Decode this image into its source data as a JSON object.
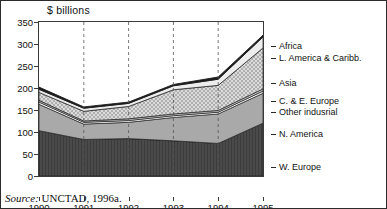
{
  "figure": {
    "axis_title": "$ billions",
    "source": "Source:",
    "source_text": " UNCTAD, 1996a."
  },
  "chart_data": {
    "type": "area",
    "title": "$ billions",
    "xlabel": "",
    "ylabel": "$ billions",
    "ylim": [
      0,
      350
    ],
    "ytick_step": 50,
    "yticks": [
      0,
      50,
      100,
      150,
      200,
      250,
      300,
      350
    ],
    "grid": "vertical-dashed",
    "legend_position": "right",
    "stacked": true,
    "categories": [
      "1990",
      "1991",
      "1992",
      "1993",
      "1994",
      "1995"
    ],
    "series": [
      {
        "name": "W. Europe",
        "values": [
          103,
          83,
          85,
          80,
          74,
          120
        ]
      },
      {
        "name": "N. America",
        "values": [
          60,
          35,
          37,
          53,
          67,
          68
        ]
      },
      {
        "name": "Other indusrial",
        "values": [
          5,
          4,
          4,
          4,
          4,
          5
        ]
      },
      {
        "name": "C. & E. Europe",
        "values": [
          4,
          3,
          4,
          4,
          4,
          5
        ]
      },
      {
        "name": "Asia",
        "values": [
          18,
          22,
          28,
          55,
          57,
          93
        ]
      },
      {
        "name": "L. America & Caribb.",
        "values": [
          7,
          7,
          7,
          9,
          14,
          25
        ]
      },
      {
        "name": "Africa",
        "values": [
          5,
          3,
          3,
          3,
          5,
          4
        ]
      }
    ],
    "totals": [
      202,
      157,
      168,
      208,
      225,
      320
    ]
  },
  "axis": {
    "y_labels": [
      "350",
      "300",
      "250",
      "200",
      "150",
      "100",
      "50",
      "0"
    ],
    "x_labels": [
      "1990",
      "1991",
      "1992",
      "1993",
      "1994",
      "1995"
    ]
  },
  "legend": {
    "items": [
      {
        "label": "Africa"
      },
      {
        "label": "L. America & Caribb."
      },
      {
        "label": "Asia"
      },
      {
        "label": "C. & E. Europe"
      },
      {
        "label": "Other indusrial"
      },
      {
        "label": "N. America"
      },
      {
        "label": "W. Europe"
      }
    ]
  },
  "colors": {
    "w_europe": "#4a4a4a",
    "n_america": "#a9a9a9",
    "other_industrial": "#ffffff",
    "c_e_europe": "#c9c9c9",
    "asia": "#d0d0d0",
    "l_america": "#e8e8e8",
    "africa": "#1c1c1c",
    "axis": "#3a3a3a",
    "text": "#111111"
  }
}
